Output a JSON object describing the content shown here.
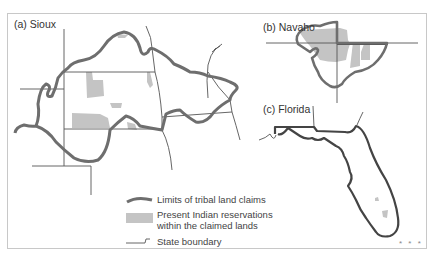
{
  "figure": {
    "panels": [
      {
        "id": "a",
        "label": "(a) Sioux"
      },
      {
        "id": "b",
        "label": "(b) Navaho"
      },
      {
        "id": "c",
        "label": "(c) Florida"
      }
    ],
    "legend": {
      "items": [
        {
          "symbol": "thick-gray-line",
          "label": "Limits of tribal land claims"
        },
        {
          "symbol": "gray-fill",
          "label": "Present Indian reservations",
          "label2": "within the claimed lands"
        },
        {
          "symbol": "thin-line",
          "label": "State boundary"
        }
      ]
    },
    "footer_mark": "* * *",
    "colors": {
      "claim_line": "#6e6e6e",
      "reservation_fill": "#c4c4c4",
      "state_line": "#555555",
      "frame": "#c8c8c8",
      "text": "#333333"
    }
  }
}
